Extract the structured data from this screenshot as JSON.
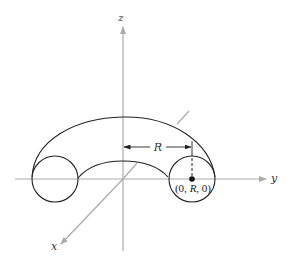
{
  "figure": {
    "type": "torus-diagram",
    "axes": {
      "x_label": "x",
      "y_label": "y",
      "z_label": "z",
      "color": "#aaaaaa"
    },
    "dimension": {
      "label": "R"
    },
    "point": {
      "label": "(0, R, 0)",
      "label_parts": [
        "(0, ",
        "R",
        ", 0)"
      ]
    },
    "colors": {
      "curve": "#222222",
      "axis": "#aaaaaa",
      "background": "#ffffff"
    }
  }
}
